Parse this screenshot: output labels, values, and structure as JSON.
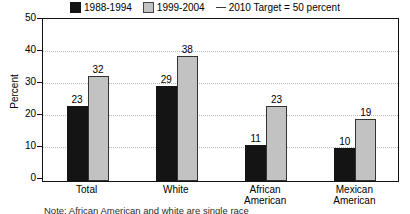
{
  "chart_data": {
    "type": "bar",
    "title": "",
    "xlabel": "",
    "ylabel": "Percent",
    "ylim": [
      0,
      50
    ],
    "yticks": [
      0,
      10,
      20,
      30,
      40,
      50
    ],
    "grid": true,
    "legend_position": "top",
    "categories": [
      "Total",
      "White",
      "African\nAmerican",
      "Mexican\nAmerican"
    ],
    "series": [
      {
        "name": "1988-1994",
        "color": "#141414",
        "values": [
          23,
          29,
          11,
          10
        ]
      },
      {
        "name": "1999-2004",
        "color": "#c2c2c2",
        "values": [
          32,
          38,
          23,
          19
        ]
      }
    ],
    "annotations": [
      {
        "name": "2010 Target = 50 percent",
        "type": "line-marker",
        "value": 50
      }
    ]
  },
  "legend": {
    "items": [
      {
        "label": "1988-1994",
        "marker": "black-square-swatch"
      },
      {
        "label": "1999-2004",
        "marker": "gray-square-swatch"
      },
      {
        "label": "2010 Target = 50 percent",
        "marker": "line-marker"
      }
    ]
  },
  "axis": {
    "y_title": "Percent",
    "y_ticks": [
      "50",
      "40",
      "30",
      "20",
      "10",
      "0"
    ]
  },
  "footnote": {
    "text": "Note: African American and white are single race"
  }
}
